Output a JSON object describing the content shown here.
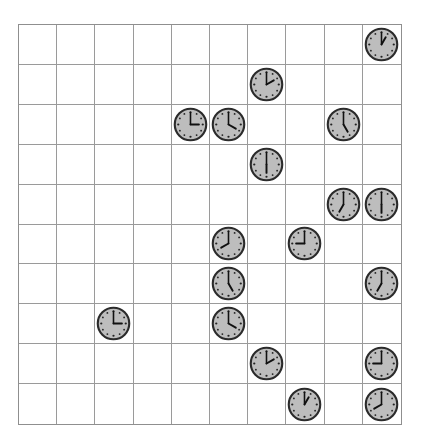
{
  "board": {
    "rows": 10,
    "cols": 10,
    "grid_color": "#9a9a9a",
    "clock_face_color": "#bdbdbd",
    "clock_rim_color": "#2b2b2b",
    "clocks": [
      {
        "row": 0,
        "col": 9,
        "time": "1:00",
        "hour": 1
      },
      {
        "row": 1,
        "col": 6,
        "time": "2:00",
        "hour": 2
      },
      {
        "row": 2,
        "col": 4,
        "time": "3:00",
        "hour": 3
      },
      {
        "row": 2,
        "col": 5,
        "time": "4:00",
        "hour": 4
      },
      {
        "row": 2,
        "col": 8,
        "time": "5:00",
        "hour": 5
      },
      {
        "row": 3,
        "col": 6,
        "time": "6:00",
        "hour": 6
      },
      {
        "row": 4,
        "col": 8,
        "time": "7:00",
        "hour": 7
      },
      {
        "row": 4,
        "col": 9,
        "time": "6:00",
        "hour": 6
      },
      {
        "row": 5,
        "col": 5,
        "time": "8:00",
        "hour": 8
      },
      {
        "row": 5,
        "col": 7,
        "time": "9:00",
        "hour": 9
      },
      {
        "row": 6,
        "col": 5,
        "time": "5:00",
        "hour": 5
      },
      {
        "row": 6,
        "col": 9,
        "time": "7:00",
        "hour": 7
      },
      {
        "row": 7,
        "col": 2,
        "time": "3:00",
        "hour": 3
      },
      {
        "row": 7,
        "col": 5,
        "time": "4:00",
        "hour": 4
      },
      {
        "row": 8,
        "col": 6,
        "time": "2:00",
        "hour": 2
      },
      {
        "row": 8,
        "col": 9,
        "time": "9:00",
        "hour": 9
      },
      {
        "row": 9,
        "col": 7,
        "time": "1:00",
        "hour": 1
      },
      {
        "row": 9,
        "col": 9,
        "time": "8:00",
        "hour": 8
      }
    ]
  }
}
